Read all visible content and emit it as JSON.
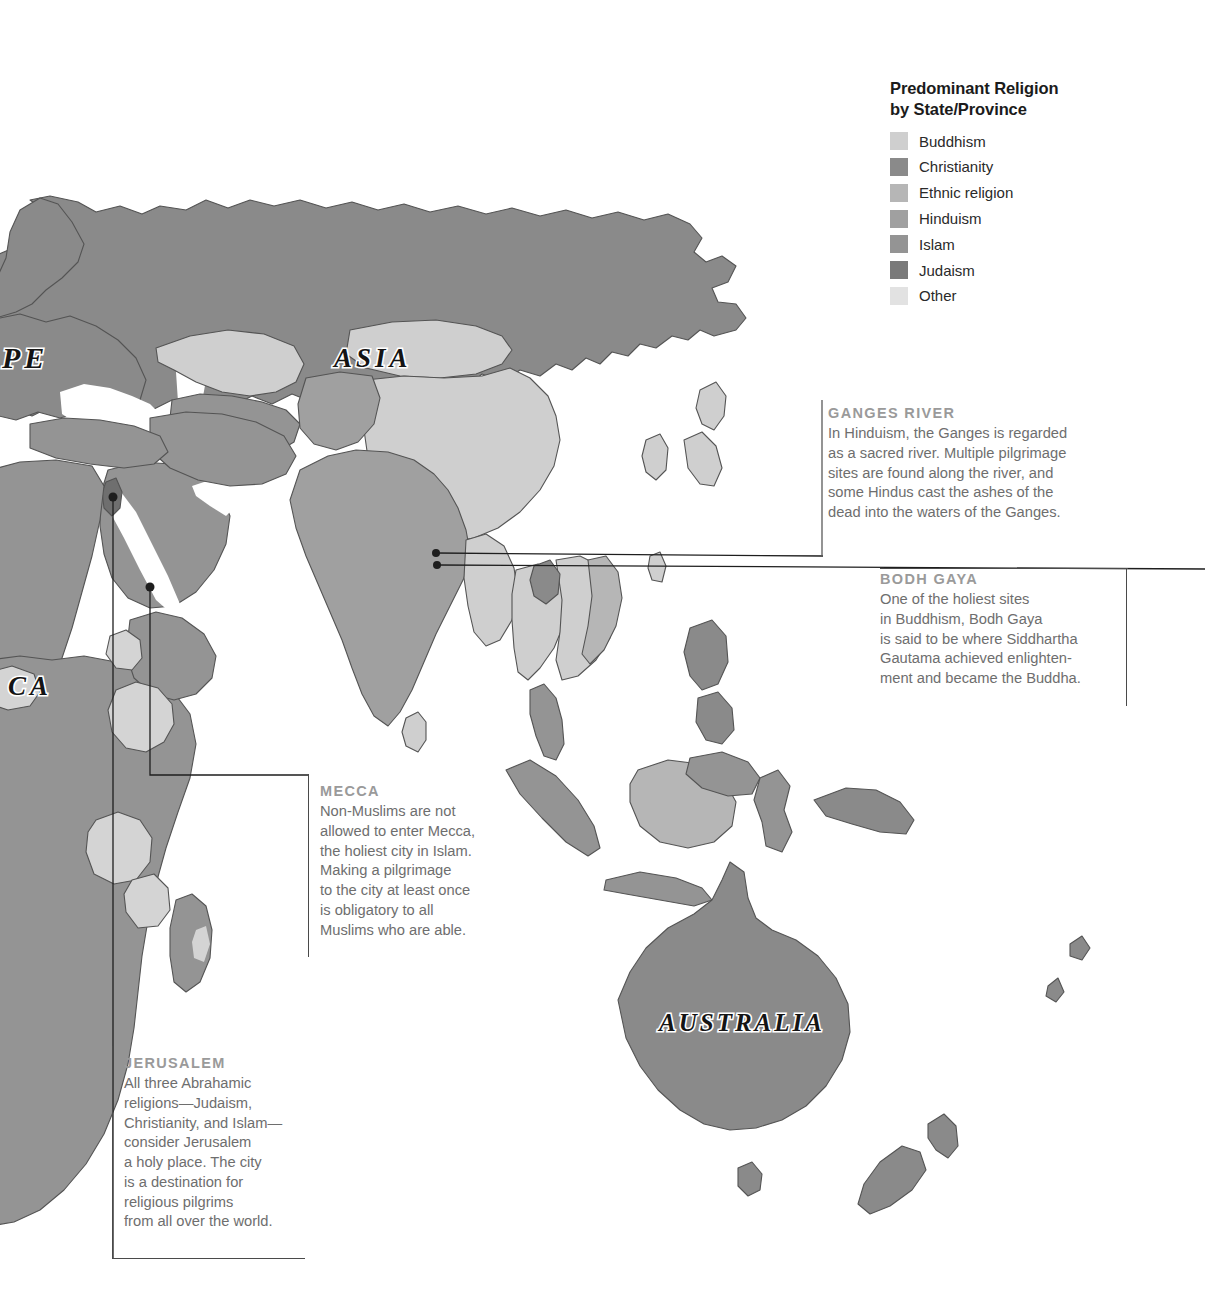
{
  "legend": {
    "title": "Predominant Religion\nby State/Province",
    "items": [
      {
        "label": "Buddhism",
        "color": "#cfcfcf"
      },
      {
        "label": "Christianity",
        "color": "#8a8a8a"
      },
      {
        "label": "Ethnic religion",
        "color": "#b6b6b6"
      },
      {
        "label": "Hinduism",
        "color": "#a0a0a0"
      },
      {
        "label": "Islam",
        "color": "#949494"
      },
      {
        "label": "Judaism",
        "color": "#7a7a7a"
      },
      {
        "label": "Other",
        "color": "#e2e2e2"
      }
    ]
  },
  "map_labels": [
    {
      "name": "europe",
      "text": "PE"
    },
    {
      "name": "asia",
      "text": "A S I A"
    },
    {
      "name": "africa",
      "text": "C A"
    },
    {
      "name": "australia",
      "text": "AUSTRALIA"
    }
  ],
  "callouts": {
    "ganges": {
      "title": "GANGES RIVER",
      "body": "In Hinduism, the Ganges is regarded\nas a sacred river. Multiple pilgrimage\nsites are found along the river, and\nsome Hindus cast the ashes of the\ndead into the waters of the Ganges."
    },
    "bodh_gaya": {
      "title": "BODH GAYA",
      "body": "One of the holiest sites\nin Buddhism, Bodh Gaya\nis said to be where Siddhartha\nGautama achieved enlighten-\nment and became the Buddha."
    },
    "mecca": {
      "title": "MECCA",
      "body": "Non-Muslims are not\nallowed to enter Mecca,\nthe holiest city in Islam.\nMaking a pilgrimage\nto the city at least once\nis obligatory to all\nMuslims who are able."
    },
    "jerusalem": {
      "title": "JERUSALEM",
      "body": "All three Abrahamic\nreligions—Judaism,\nChristianity, and Islam—\nconsider Jerusalem\na holy place. The city\nis a destination for\nreligious pilgrims\nfrom all over the world."
    }
  },
  "colors": {
    "ocean": "#ffffff",
    "land_default": "#949494",
    "buddhism": "#cfcfcf",
    "christianity": "#8a8a8a",
    "ethnic": "#b6b6b6",
    "hinduism": "#a0a0a0",
    "islam": "#949494",
    "judaism": "#6f6f6f",
    "other": "#e2e2e2",
    "border": "#545454",
    "leader": "#1e1e1e",
    "rule": "#5a5a5a",
    "title_text": "#9a9a9a",
    "body_text": "#6e6e6e"
  }
}
